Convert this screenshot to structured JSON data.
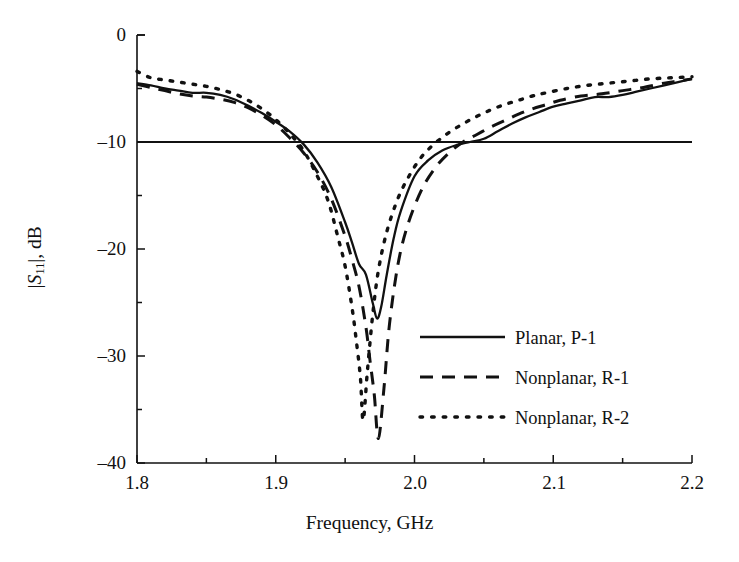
{
  "figure": {
    "background": "#ffffff",
    "ink_color": "#111111"
  },
  "axes": {
    "x": {
      "title": "Frequency, GHz",
      "min": 1.8,
      "max": 2.2,
      "major_ticks": [
        1.8,
        1.9,
        2.0,
        2.1,
        2.2
      ],
      "tick_labels": [
        "1.8",
        "1.9",
        "2.0",
        "2.1",
        "2.2"
      ],
      "minor_tick_step": 0.05
    },
    "y": {
      "title_prefix": "|",
      "title_italic": "S",
      "title_subscript": "11",
      "title_suffix": "|, dB",
      "title_plain": "|S11|, dB",
      "min": -40,
      "max": 0,
      "major_ticks": [
        0,
        -10,
        -20,
        -30,
        -40
      ],
      "tick_labels": [
        "0",
        "–10",
        "–20",
        "–30",
        "–40"
      ],
      "minor_tick_step": 5
    }
  },
  "reference_line": {
    "name": "minus-10-db-reference",
    "value": -10,
    "style": "solid"
  },
  "legend": {
    "entries": [
      {
        "label": "Planar, P-1",
        "style": "solid"
      },
      {
        "label": "Nonplanar, R-1",
        "style": "dashed"
      },
      {
        "label": "Nonplanar, R-2",
        "style": "dotted"
      }
    ]
  },
  "chart_data": {
    "type": "line",
    "title": "",
    "xlabel": "Frequency, GHz",
    "ylabel": "|S11|, dB",
    "xlim": [
      1.8,
      2.2
    ],
    "ylim": [
      -40,
      0
    ],
    "grid": false,
    "legend_position": "center-right-inside",
    "annotations": [
      {
        "type": "hline",
        "y": -10,
        "label": "-10 dB reference"
      }
    ],
    "series": [
      {
        "name": "Planar, P-1",
        "style": "solid",
        "color": "#111111",
        "x": [
          1.8,
          1.81,
          1.82,
          1.83,
          1.84,
          1.85,
          1.86,
          1.87,
          1.88,
          1.89,
          1.9,
          1.91,
          1.92,
          1.93,
          1.94,
          1.95,
          1.955,
          1.96,
          1.965,
          1.97,
          1.973,
          1.976,
          1.98,
          1.985,
          1.99,
          2.0,
          2.01,
          2.02,
          2.03,
          2.04,
          2.05,
          2.06,
          2.07,
          2.08,
          2.09,
          2.1,
          2.11,
          2.12,
          2.13,
          2.14,
          2.15,
          2.16,
          2.17,
          2.18,
          2.19,
          2.2
        ],
        "y": [
          -4.5,
          -4.7,
          -5.0,
          -5.2,
          -5.4,
          -5.4,
          -5.6,
          -6.0,
          -6.6,
          -7.3,
          -8.1,
          -9.0,
          -10.2,
          -11.9,
          -14.2,
          -17.5,
          -19.4,
          -21.4,
          -22.4,
          -25.1,
          -26.5,
          -25.4,
          -22.4,
          -19.0,
          -16.5,
          -13.2,
          -11.7,
          -10.8,
          -10.3,
          -10.0,
          -9.7,
          -9.0,
          -8.3,
          -7.7,
          -7.2,
          -6.7,
          -6.4,
          -6.1,
          -5.8,
          -5.8,
          -5.6,
          -5.3,
          -5.0,
          -4.7,
          -4.4,
          -4.1
        ]
      },
      {
        "name": "Nonplanar, R-1",
        "style": "dashed",
        "color": "#111111",
        "x": [
          1.8,
          1.81,
          1.82,
          1.83,
          1.84,
          1.85,
          1.86,
          1.87,
          1.88,
          1.89,
          1.9,
          1.91,
          1.92,
          1.93,
          1.94,
          1.95,
          1.955,
          1.96,
          1.965,
          1.968,
          1.971,
          1.974,
          1.978,
          1.982,
          1.988,
          1.995,
          2.005,
          2.015,
          2.025,
          2.035,
          2.045,
          2.055,
          2.065,
          2.075,
          2.085,
          2.095,
          2.105,
          2.12,
          2.135,
          2.15,
          2.165,
          2.18,
          2.19,
          2.2
        ],
        "y": [
          -4.6,
          -4.9,
          -5.2,
          -5.5,
          -5.7,
          -5.8,
          -6.0,
          -6.3,
          -6.8,
          -7.5,
          -8.4,
          -9.6,
          -11.0,
          -12.8,
          -15.3,
          -18.8,
          -21.0,
          -23.5,
          -27.3,
          -30.5,
          -33.6,
          -37.7,
          -33.0,
          -27.0,
          -21.5,
          -17.8,
          -14.5,
          -12.4,
          -11.0,
          -10.0,
          -9.3,
          -8.6,
          -8.0,
          -7.4,
          -6.9,
          -6.5,
          -6.1,
          -5.7,
          -5.5,
          -5.2,
          -4.9,
          -4.5,
          -4.3,
          -4.1
        ]
      },
      {
        "name": "Nonplanar, R-2",
        "style": "dotted",
        "color": "#111111",
        "x": [
          1.8,
          1.81,
          1.82,
          1.83,
          1.84,
          1.85,
          1.86,
          1.87,
          1.88,
          1.89,
          1.9,
          1.91,
          1.92,
          1.93,
          1.938,
          1.945,
          1.95,
          1.955,
          1.958,
          1.961,
          1.963,
          1.966,
          1.97,
          1.974,
          1.98,
          1.988,
          1.996,
          2.005,
          2.015,
          2.025,
          2.035,
          2.045,
          2.055,
          2.065,
          2.075,
          2.085,
          2.095,
          2.11,
          2.125,
          2.14,
          2.155,
          2.17,
          2.185,
          2.2
        ],
        "y": [
          -3.4,
          -4.0,
          -4.2,
          -4.4,
          -4.6,
          -4.8,
          -5.1,
          -5.5,
          -6.1,
          -6.9,
          -7.9,
          -9.2,
          -10.8,
          -13.2,
          -15.6,
          -19.0,
          -21.6,
          -25.5,
          -28.5,
          -32.0,
          -36.0,
          -31.5,
          -26.0,
          -22.0,
          -18.4,
          -15.3,
          -13.2,
          -11.4,
          -10.1,
          -9.1,
          -8.3,
          -7.6,
          -7.0,
          -6.5,
          -6.1,
          -5.7,
          -5.4,
          -5.0,
          -4.7,
          -4.5,
          -4.3,
          -4.1,
          -4.0,
          -3.9
        ]
      }
    ]
  },
  "plot_geometry": {
    "left_px": 137,
    "right_px": 692,
    "top_px": 35,
    "bottom_px": 463
  }
}
